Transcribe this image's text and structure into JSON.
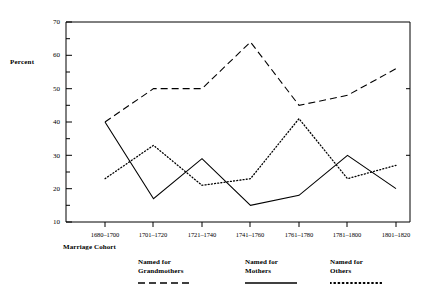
{
  "axes": {
    "ylabel": "Percent",
    "xlabel": "Marriage Cohort",
    "yticks": [
      "70",
      "60",
      "50",
      "40",
      "30",
      "20",
      "10"
    ],
    "ylim": [
      10,
      70
    ],
    "xticks": [
      "1680–1700",
      "1701–1720",
      "1721–1740",
      "1741–1760",
      "1761–1780",
      "1781–1800",
      "1801–1820"
    ]
  },
  "legend": {
    "items": [
      {
        "line1": "Named for",
        "line2": "Grandmothers",
        "style": "dashed"
      },
      {
        "line1": "Named for",
        "line2": "Mothers",
        "style": "solid"
      },
      {
        "line1": "Named for",
        "line2": "Others",
        "style": "dotted"
      }
    ]
  },
  "chart_data": {
    "type": "line",
    "title": "",
    "xlabel": "Marriage Cohort",
    "ylabel": "Percent",
    "ylim": [
      10,
      70
    ],
    "grid": false,
    "legend_position": "bottom",
    "categories": [
      "1680–1700",
      "1701–1720",
      "1721–1740",
      "1741–1760",
      "1761–1780",
      "1781–1800",
      "1801–1820"
    ],
    "series": [
      {
        "name": "Named for Grandmothers",
        "style": "dashed",
        "values": [
          40,
          50,
          50,
          64,
          45,
          48,
          56
        ]
      },
      {
        "name": "Named for Mothers",
        "style": "solid",
        "values": [
          40,
          17,
          29,
          15,
          18,
          30,
          20
        ]
      },
      {
        "name": "Named for Others",
        "style": "dotted",
        "values": [
          23,
          33,
          21,
          23,
          41,
          23,
          27
        ]
      }
    ]
  }
}
